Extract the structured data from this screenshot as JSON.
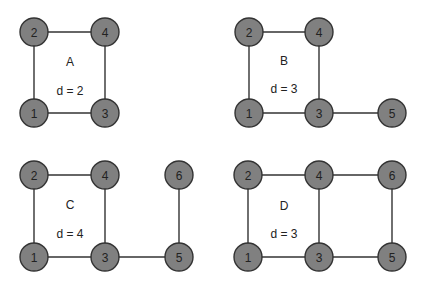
{
  "style": {
    "node_fill": "#808080",
    "node_stroke": "#333333",
    "edge_color": "#333333",
    "node_radius": 14
  },
  "graphs": [
    {
      "id": "A",
      "name": "A",
      "d_label": "d = 2",
      "name_pos": [
        70,
        62
      ],
      "d_pos": [
        70,
        91
      ],
      "nodes": [
        {
          "id": "1",
          "x": 34,
          "y": 113
        },
        {
          "id": "2",
          "x": 34,
          "y": 32
        },
        {
          "id": "3",
          "x": 105,
          "y": 113
        },
        {
          "id": "4",
          "x": 105,
          "y": 32
        }
      ],
      "edges": [
        [
          "1",
          "2"
        ],
        [
          "2",
          "4"
        ],
        [
          "4",
          "3"
        ],
        [
          "1",
          "3"
        ]
      ]
    },
    {
      "id": "B",
      "name": "B",
      "d_label": "d = 3",
      "name_pos": [
        284,
        61
      ],
      "d_pos": [
        284,
        89
      ],
      "nodes": [
        {
          "id": "1",
          "x": 249,
          "y": 113
        },
        {
          "id": "2",
          "x": 249,
          "y": 32
        },
        {
          "id": "3",
          "x": 319,
          "y": 113
        },
        {
          "id": "4",
          "x": 319,
          "y": 32
        },
        {
          "id": "5",
          "x": 392,
          "y": 113
        }
      ],
      "edges": [
        [
          "1",
          "2"
        ],
        [
          "2",
          "4"
        ],
        [
          "4",
          "3"
        ],
        [
          "1",
          "3"
        ],
        [
          "3",
          "5"
        ]
      ]
    },
    {
      "id": "C",
      "name": "C",
      "d_label": "d = 4",
      "name_pos": [
        70,
        205
      ],
      "d_pos": [
        70,
        234
      ],
      "nodes": [
        {
          "id": "1",
          "x": 34,
          "y": 257
        },
        {
          "id": "2",
          "x": 34,
          "y": 175
        },
        {
          "id": "3",
          "x": 105,
          "y": 257
        },
        {
          "id": "4",
          "x": 105,
          "y": 175
        },
        {
          "id": "5",
          "x": 179,
          "y": 257
        },
        {
          "id": "6",
          "x": 179,
          "y": 175
        }
      ],
      "edges": [
        [
          "1",
          "2"
        ],
        [
          "2",
          "4"
        ],
        [
          "4",
          "3"
        ],
        [
          "1",
          "3"
        ],
        [
          "3",
          "5"
        ],
        [
          "5",
          "6"
        ]
      ]
    },
    {
      "id": "D",
      "name": "D",
      "d_label": "d = 3",
      "name_pos": [
        284,
        206
      ],
      "d_pos": [
        284,
        234
      ],
      "nodes": [
        {
          "id": "1",
          "x": 248,
          "y": 257
        },
        {
          "id": "2",
          "x": 248,
          "y": 175
        },
        {
          "id": "3",
          "x": 319,
          "y": 257
        },
        {
          "id": "4",
          "x": 319,
          "y": 175
        },
        {
          "id": "5",
          "x": 392,
          "y": 257
        },
        {
          "id": "6",
          "x": 392,
          "y": 175
        }
      ],
      "edges": [
        [
          "1",
          "2"
        ],
        [
          "2",
          "4"
        ],
        [
          "4",
          "3"
        ],
        [
          "1",
          "3"
        ],
        [
          "3",
          "5"
        ],
        [
          "4",
          "6"
        ],
        [
          "6",
          "5"
        ]
      ]
    }
  ]
}
